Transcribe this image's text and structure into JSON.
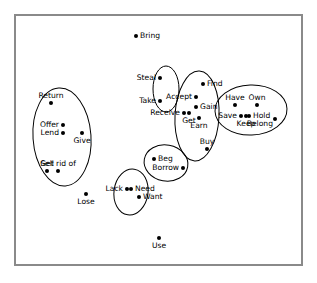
{
  "figure": {
    "type": "scatter-diagram",
    "border_color": "#8a8a8a",
    "point_color": "#000000",
    "frame": {
      "x": 14,
      "y": 14,
      "w": 289,
      "h": 252
    }
  },
  "chart_data": {
    "type": "scatter",
    "title": "",
    "xlabel": "",
    "ylabel": "",
    "grid": false,
    "legend": "none",
    "xlim": [
      14,
      303
    ],
    "ylim": [
      14,
      266
    ],
    "points": [
      {
        "label": "Bring",
        "x": 136,
        "y": 36,
        "pos": "r"
      },
      {
        "label": "Steal",
        "x": 160,
        "y": 78,
        "pos": "l"
      },
      {
        "label": "Take",
        "x": 160,
        "y": 101,
        "pos": "l"
      },
      {
        "label": "Return",
        "x": 51,
        "y": 103,
        "pos": "above"
      },
      {
        "label": "Offer",
        "x": 63,
        "y": 125,
        "pos": "l"
      },
      {
        "label": "Lend",
        "x": 63,
        "y": 133,
        "pos": "l"
      },
      {
        "label": "Give",
        "x": 82,
        "y": 133,
        "pos": "below"
      },
      {
        "label": "Sell",
        "x": 47,
        "y": 171,
        "pos": "above"
      },
      {
        "label": "Get rid of",
        "x": 58,
        "y": 171,
        "pos": "above"
      },
      {
        "label": "Find",
        "x": 203,
        "y": 84,
        "pos": "r"
      },
      {
        "label": "Accept",
        "x": 196,
        "y": 97,
        "pos": "l"
      },
      {
        "label": "Gain",
        "x": 196,
        "y": 107,
        "pos": "r"
      },
      {
        "label": "Receive",
        "x": 184,
        "y": 113,
        "pos": "l"
      },
      {
        "label": "Get",
        "x": 189,
        "y": 113,
        "pos": "below"
      },
      {
        "label": "Earn",
        "x": 199,
        "y": 118,
        "pos": "below"
      },
      {
        "label": "Have",
        "x": 235,
        "y": 105,
        "pos": "above"
      },
      {
        "label": "Own",
        "x": 257,
        "y": 105,
        "pos": "above"
      },
      {
        "label": "Save",
        "x": 241,
        "y": 116,
        "pos": "l"
      },
      {
        "label": "Keep",
        "x": 246,
        "y": 116,
        "pos": "below"
      },
      {
        "label": "Hold",
        "x": 249,
        "y": 116,
        "pos": "r"
      },
      {
        "label": "Belong",
        "x": 275,
        "y": 119,
        "pos": "lbelow"
      },
      {
        "label": "Buy",
        "x": 207,
        "y": 149,
        "pos": "above"
      },
      {
        "label": "Beg",
        "x": 154,
        "y": 159,
        "pos": "r"
      },
      {
        "label": "Borrow",
        "x": 183,
        "y": 168,
        "pos": "l"
      },
      {
        "label": "Lack",
        "x": 127,
        "y": 189,
        "pos": "l"
      },
      {
        "label": "Need",
        "x": 131,
        "y": 189,
        "pos": "r"
      },
      {
        "label": "Want",
        "x": 139,
        "y": 197,
        "pos": "r"
      },
      {
        "label": "Lose",
        "x": 86,
        "y": 194,
        "pos": "below"
      },
      {
        "label": "Use",
        "x": 159,
        "y": 238,
        "pos": "below"
      }
    ],
    "clusters": [
      {
        "name": "give-cluster",
        "members": [
          "Return",
          "Offer",
          "Lend",
          "Give",
          "Sell",
          "Get rid of"
        ],
        "cx": 62,
        "cy": 137,
        "rx": 29,
        "ry": 49,
        "rot": -4
      },
      {
        "name": "steal-cluster",
        "members": [
          "Steal",
          "Take"
        ],
        "cx": 166,
        "cy": 89,
        "rx": 13,
        "ry": 23,
        "rot": 0
      },
      {
        "name": "acquire-cluster",
        "members": [
          "Accept",
          "Find",
          "Gain",
          "Receive",
          "Get",
          "Earn",
          "Buy"
        ],
        "cx": 197,
        "cy": 116,
        "rx": 22,
        "ry": 45,
        "rot": 3
      },
      {
        "name": "possess-cluster",
        "members": [
          "Have",
          "Own",
          "Save",
          "Keep",
          "Hold",
          "Belong"
        ],
        "cx": 251,
        "cy": 110,
        "rx": 36,
        "ry": 25,
        "rot": -2
      },
      {
        "name": "beg-cluster",
        "members": [
          "Beg",
          "Borrow"
        ],
        "cx": 166,
        "cy": 163,
        "rx": 22,
        "ry": 18,
        "rot": 10
      },
      {
        "name": "need-cluster",
        "members": [
          "Lack",
          "Need",
          "Want"
        ],
        "cx": 131,
        "cy": 192,
        "rx": 17,
        "ry": 23,
        "rot": 8
      }
    ]
  }
}
